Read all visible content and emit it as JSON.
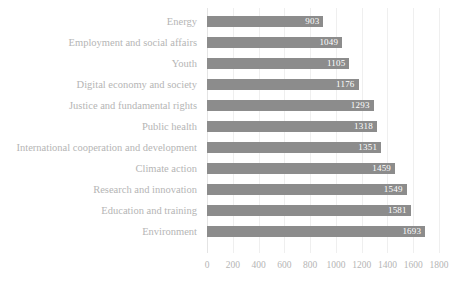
{
  "chart_data": {
    "type": "bar",
    "orientation": "horizontal",
    "title": "",
    "xlabel": "",
    "ylabel": "",
    "xlim": [
      0,
      1800
    ],
    "grid": true,
    "legend": false,
    "data_labels": true,
    "bar_color": "#8c8c8c",
    "label_color": "#b5b5b5",
    "value_label_color": "#ffffff",
    "gridline_color": "#efefef",
    "xticks": [
      0,
      200,
      400,
      600,
      800,
      1000,
      1200,
      1400,
      1600,
      1800
    ],
    "xtick_labels": [
      "0",
      "200",
      "400",
      "600",
      "800",
      "1000",
      "1200",
      "1400",
      "1600",
      "1800"
    ],
    "categories": [
      "Energy",
      "Employment and social affairs",
      "Youth",
      "Digital economy and society",
      "Justice and fundamental rights",
      "Public health",
      "International cooperation and development",
      "Climate action",
      "Research and innovation",
      "Education and training",
      "Environment"
    ],
    "values": [
      903,
      1049,
      1105,
      1176,
      1293,
      1318,
      1351,
      1459,
      1549,
      1581,
      1693
    ],
    "value_labels": [
      "903",
      "1049",
      "1105",
      "1176",
      "1293",
      "1318",
      "1351",
      "1459",
      "1549",
      "1581",
      "1693"
    ]
  }
}
